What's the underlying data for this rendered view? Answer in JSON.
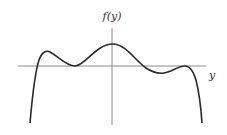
{
  "figure": {
    "y_axis_label": "f(y)",
    "x_axis_label": "y",
    "curve_color": "#2a2a2a",
    "axis_color": "#888888"
  }
}
